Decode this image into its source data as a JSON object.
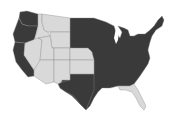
{
  "map": {
    "title": "",
    "region": "Contiguous United States",
    "colors": {
      "dark": "#3a3a3a",
      "light": "#d9d9d9",
      "background": "#ffffff"
    },
    "states": [
      {
        "name": "Washington",
        "fill": "dark"
      },
      {
        "name": "Oregon",
        "fill": "dark"
      },
      {
        "name": "California",
        "fill": "dark"
      },
      {
        "name": "Idaho",
        "fill": "light"
      },
      {
        "name": "Montana",
        "fill": "light"
      },
      {
        "name": "Wyoming",
        "fill": "light"
      },
      {
        "name": "Nevada",
        "fill": "light"
      },
      {
        "name": "Utah",
        "fill": "light"
      },
      {
        "name": "Colorado",
        "fill": "light"
      },
      {
        "name": "Arizona",
        "fill": "light"
      },
      {
        "name": "New Mexico",
        "fill": "light"
      },
      {
        "name": "North Dakota",
        "fill": "dark"
      },
      {
        "name": "South Dakota",
        "fill": "dark"
      },
      {
        "name": "Nebraska",
        "fill": "light"
      },
      {
        "name": "Kansas",
        "fill": "light"
      },
      {
        "name": "Texas",
        "fill": "dark"
      },
      {
        "name": "Eastern states",
        "fill": "dark"
      },
      {
        "name": "Florida",
        "fill": "light"
      }
    ]
  }
}
